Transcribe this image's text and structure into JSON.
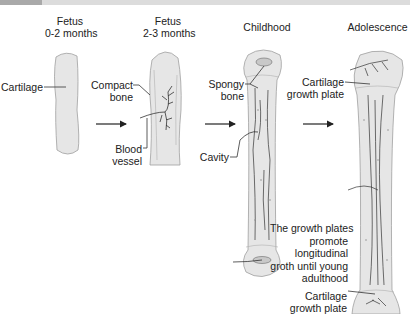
{
  "stages": [
    {
      "title_line1": "Fetus",
      "title_line2": "0-2 months"
    },
    {
      "title_line1": "Fetus",
      "title_line2": "2-3 months"
    },
    {
      "title_line1": "Childhood"
    },
    {
      "title_line1": "Adolescence"
    }
  ],
  "labels": {
    "cartilage": "Cartilage",
    "compact_bone_1": "Compact",
    "compact_bone_2": "bone",
    "blood_vessel_1": "Blood",
    "blood_vessel_2": "vessel",
    "spongy_bone_1": "Spongy",
    "spongy_bone_2": "bone",
    "cavity": "Cavity",
    "growth_plate_top_1": "Cartilage",
    "growth_plate_top_2": "growth plate",
    "growth_plate_bottom_1": "Cartilage",
    "growth_plate_bottom_2": "growth plate"
  },
  "note": {
    "line1": "The growth plates",
    "line2": "promote",
    "line3": "longitudinal",
    "line4": "groth until young",
    "line5": "adulthood"
  },
  "colors": {
    "bone_fill": "#e6e6e6",
    "bone_stroke": "#9a9a9a",
    "vessel": "#333333"
  }
}
